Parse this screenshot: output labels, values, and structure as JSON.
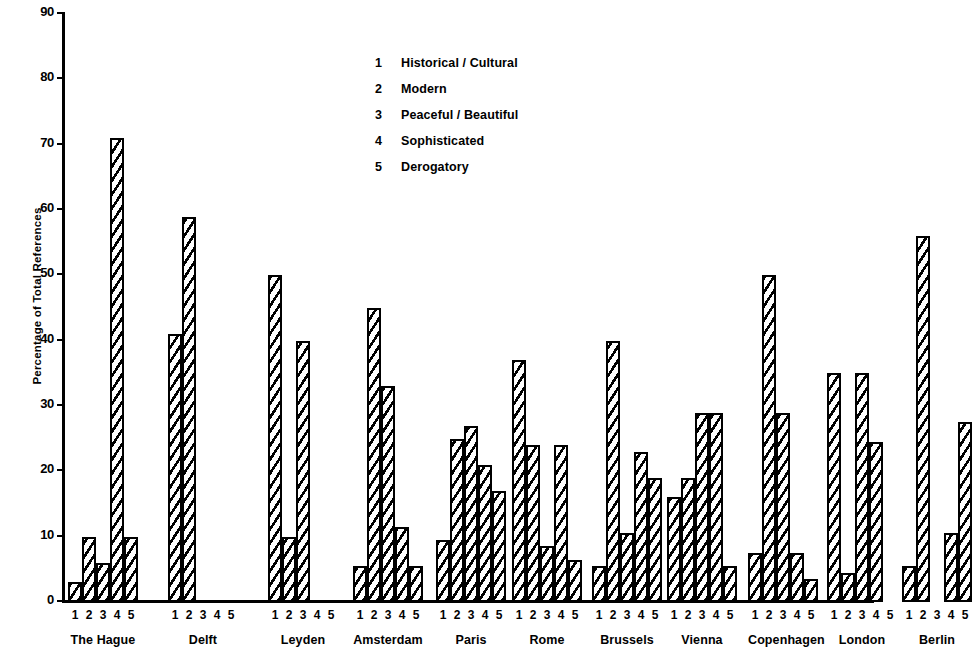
{
  "chart_data": {
    "type": "bar",
    "title": "",
    "xlabel": "",
    "ylabel": "Percentage of Total References",
    "ylim": [
      0,
      90
    ],
    "ytick_labels": [
      "0",
      "10",
      "20",
      "30",
      "40",
      "50",
      "60",
      "70",
      "80",
      "90"
    ],
    "yticks": [
      0,
      10,
      20,
      30,
      40,
      50,
      60,
      70,
      80,
      90
    ],
    "grid": false,
    "legend_position": "upper-center",
    "categories": [
      "The Hague",
      "Delft",
      "Leyden",
      "Amsterdam",
      "Paris",
      "Rome",
      "Brussels",
      "Vienna",
      "Copenhagen",
      "London",
      "Berlin"
    ],
    "group_tick_labels": [
      "1",
      "2",
      "3",
      "4",
      "5"
    ],
    "series": [
      {
        "name": "Historical / Cultural",
        "key": "1",
        "values": [
          3,
          41,
          50,
          5.5,
          9.5,
          37,
          5.5,
          16,
          7.5,
          35,
          5.5
        ]
      },
      {
        "name": "Modern",
        "key": "2",
        "values": [
          10,
          59,
          10,
          45,
          25,
          24,
          40,
          19,
          50,
          4.5,
          56
        ]
      },
      {
        "name": "Peaceful / Beautiful",
        "key": "3",
        "values": [
          6,
          0,
          40,
          33,
          27,
          8.5,
          10.5,
          29,
          29,
          35,
          0
        ]
      },
      {
        "name": "Sophisticated",
        "key": "4",
        "values": [
          71,
          0,
          0,
          11.5,
          21,
          24,
          23,
          29,
          7.5,
          24.5,
          10.5
        ]
      },
      {
        "name": "Derogatory",
        "key": "5",
        "values": [
          10,
          0,
          0,
          5.5,
          17,
          6.5,
          19,
          5.5,
          3.5,
          0,
          27.5
        ]
      }
    ],
    "legend": [
      {
        "key": "1",
        "label": "Historical / Cultural"
      },
      {
        "key": "2",
        "label": "Modern"
      },
      {
        "key": "3",
        "label": "Peaceful / Beautiful"
      },
      {
        "key": "4",
        "label": "Sophisticated"
      },
      {
        "key": "5",
        "label": "Derogatory"
      }
    ],
    "colors": {
      "axis": "#000000",
      "bar_outline": "#000000",
      "bar_hatch": "#000000",
      "bar_fill": "#ffffff",
      "background": "#ffffff"
    }
  }
}
